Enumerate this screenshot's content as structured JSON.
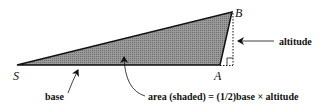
{
  "diagram": {
    "vertices": {
      "S": "S",
      "A": "A",
      "B": "B"
    },
    "labels": {
      "altitude": "altitude",
      "base": "base",
      "area": "area (shaded) = (1/2)base × altitude"
    },
    "colors": {
      "shading": "#8c8c8c",
      "stroke": "#111111"
    }
  }
}
